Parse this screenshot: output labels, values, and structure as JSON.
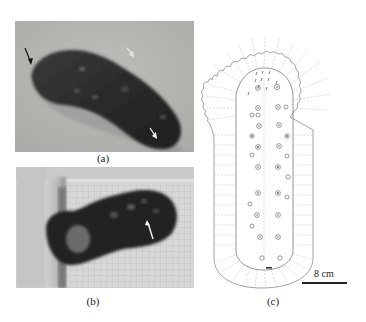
{
  "figure": {
    "panels": [
      {
        "id": "a",
        "label": "(a)",
        "type": "photograph",
        "description": "Sea cucumber specimen on sandy substrate with arrows",
        "arrows": [
          "black",
          "white",
          "white"
        ]
      },
      {
        "id": "b",
        "label": "(b)",
        "type": "photograph",
        "description": "Sea cucumber specimen in grid-lined tank with white arrow",
        "arrows": [
          "white"
        ]
      },
      {
        "id": "c",
        "label": "(c)",
        "type": "line-drawing",
        "description": "Schematic outline of specimen showing papillae and tentacle fringe"
      }
    ],
    "scale_bar": {
      "text": "8 cm"
    },
    "colors": {
      "photo_a_bg": "#b4b4b1",
      "photo_b_bg": "#d2d3d2",
      "specimen": "#2b2b2b",
      "drawing_line": "#8a8a8a"
    }
  }
}
